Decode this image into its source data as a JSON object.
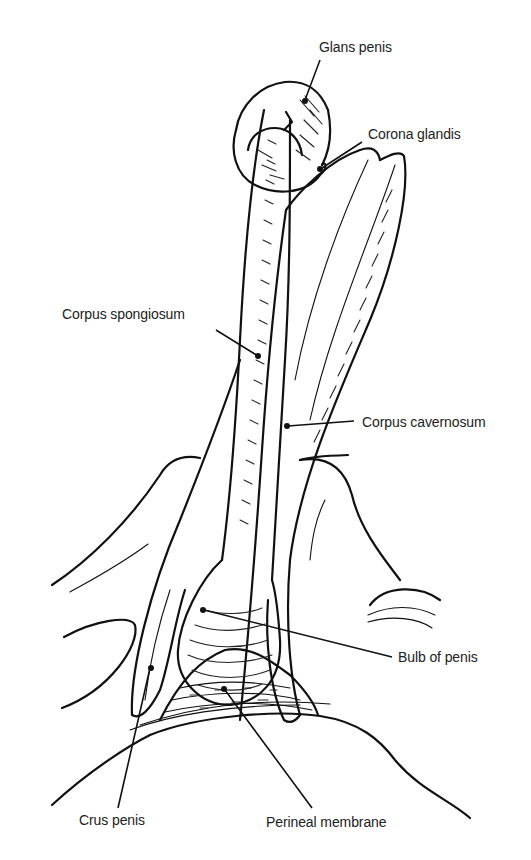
{
  "figure": {
    "background": "#ffffff",
    "ink_color": "#111111",
    "labels": [
      {
        "id": "glans",
        "text": "Glans penis",
        "x": 319,
        "y": 39
      },
      {
        "id": "corona",
        "text": "Corona glandis",
        "x": 368,
        "y": 126
      },
      {
        "id": "spongiosum",
        "text": "Corpus spongiosum",
        "x": 62,
        "y": 306
      },
      {
        "id": "cavernosum",
        "text": "Corpus cavernosum",
        "x": 362,
        "y": 414
      },
      {
        "id": "bulb",
        "text": "Bulb of penis",
        "x": 398,
        "y": 649
      },
      {
        "id": "crus",
        "text": "Crus penis",
        "x": 79,
        "y": 812
      },
      {
        "id": "perineal",
        "text": "Perineal membrane",
        "x": 266,
        "y": 814
      }
    ]
  }
}
